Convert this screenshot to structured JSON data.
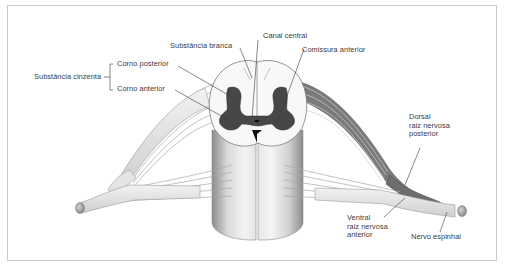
{
  "diagram": {
    "title": "",
    "colors": {
      "frame_border": "#c9c9c9",
      "gray_matter": "#4a4a4a",
      "white_matter": "#f7f7f7",
      "nerve_fill": "#e6e6e6",
      "nerve_stroke": "#9a9a9a",
      "label_text": "#3a3a3a",
      "leader_line": "#3a3a3a"
    },
    "labels": {
      "substancia_branca": "Substância branca",
      "canal_central": "Canal central",
      "comissura_anterior": "Comissura anterior",
      "substancia_cinzenta": "Substância cinzenta",
      "corno_posterior": "Corno posterior",
      "corno_anterior": "Corno anterior",
      "dorsal_line1": "Dorsal",
      "dorsal_line2": "raiz nervosa",
      "dorsal_line3": "posterior",
      "ventral_line1": "Ventral",
      "ventral_line2": "raiz nervosa",
      "ventral_line3": "anterior",
      "nervo_espinhal": "Nervo espinhal"
    }
  }
}
